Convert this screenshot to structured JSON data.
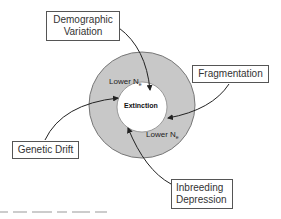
{
  "diagram": {
    "center_label": "Extinction",
    "ring_labels": [
      {
        "text": "Lower N",
        "sub": "e"
      },
      {
        "text": "Lower N",
        "sub": "e"
      }
    ],
    "factors": [
      {
        "id": "demographic",
        "line1": "Demographic",
        "line2": "Variation"
      },
      {
        "id": "fragmentation",
        "line1": "Fragmentation",
        "line2": ""
      },
      {
        "id": "genetic-drift",
        "line1": "Genetic Drift",
        "line2": ""
      },
      {
        "id": "inbreeding",
        "line1": "Inbreeding",
        "line2": "Depression"
      }
    ],
    "colors": {
      "ring_fill": "#c8c8c8",
      "ring_stroke": "#777777",
      "inner_fill": "#ffffff",
      "arrow": "#222222",
      "box_border": "#555555"
    }
  }
}
